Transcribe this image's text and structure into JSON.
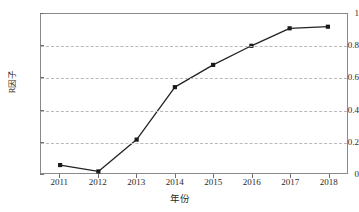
{
  "chart_data": {
    "type": "line",
    "title": "",
    "xlabel": "年份",
    "ylabel": "R因子",
    "x": [
      2011,
      2012,
      2013,
      2014,
      2015,
      2016,
      2017,
      2018
    ],
    "categories": [
      "2011",
      "2012",
      "2013",
      "2014",
      "2015",
      "2016",
      "2017",
      "2018"
    ],
    "values": [
      0.05,
      0.01,
      0.21,
      0.54,
      0.68,
      0.8,
      0.91,
      0.92
    ],
    "series": [
      {
        "name": "R因子",
        "values": [
          0.05,
          0.01,
          0.21,
          0.54,
          0.68,
          0.8,
          0.91,
          0.92
        ]
      }
    ],
    "xlim": [
      2010.5,
      2018.5
    ],
    "ylim": [
      0,
      1
    ],
    "ytick_labels": [
      "0",
      "0.2",
      "0.4",
      "0.6",
      "0.8",
      "1"
    ],
    "ytick_values": [
      0,
      0.2,
      0.4,
      0.6,
      0.8,
      1
    ],
    "xtick_labels": [
      "2011",
      "2012",
      "2013",
      "2014",
      "2015",
      "2016",
      "2017",
      "2018"
    ],
    "grid": "horizontal-dashed",
    "legend": "none",
    "marker": "square",
    "line_color": "#232323",
    "marker_color": "#1a1a1a",
    "grid_color": "#b9b9b9",
    "frame_color": "#8a8a8a"
  }
}
